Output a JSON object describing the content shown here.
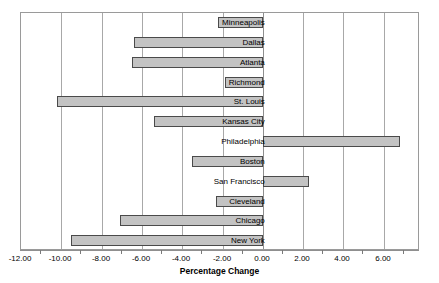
{
  "chart_data": {
    "type": "bar",
    "orientation": "horizontal",
    "title": "",
    "xlabel": "Percentage Change",
    "ylabel": "",
    "xlim": [
      -12.0,
      7.8
    ],
    "grid": true,
    "legend": false,
    "xticks": [
      -12.0,
      -10.0,
      -8.0,
      -6.0,
      -4.0,
      -2.0,
      0.0,
      2.0,
      4.0,
      6.0
    ],
    "xticklabels": [
      "-12.00",
      "-10.00",
      "-8.00",
      "-6.00",
      "-4.00",
      "-2.00",
      "0.00",
      "2.00",
      "4.00",
      "6.00"
    ],
    "categories": [
      "Minneapolis",
      "Dallas",
      "Atlanta",
      "Richmond",
      "St. Louis",
      "Kansas City",
      "Philadelphia",
      "Boston",
      "San Francisco",
      "Cleveland",
      "Chicago",
      "New York"
    ],
    "values": [
      -2.2,
      -6.4,
      -6.5,
      -1.9,
      -10.2,
      -5.4,
      6.8,
      -3.5,
      2.3,
      -2.3,
      -7.1,
      -9.5
    ],
    "bar_fill": "#c3c3c3",
    "bar_edge": "#4a4a4a",
    "grid_color": "#a8a8a8",
    "frame_color": "#9a9a9a"
  }
}
